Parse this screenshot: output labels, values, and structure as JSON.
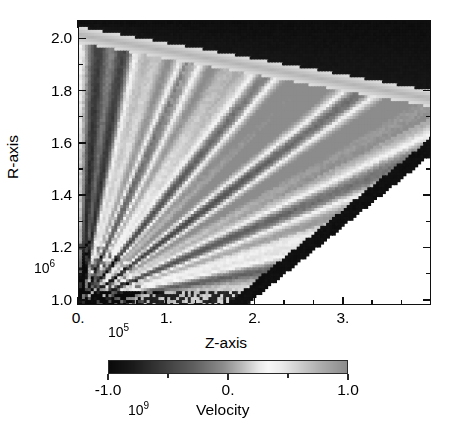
{
  "figure": {
    "kind": "pseudocolor-image-plot"
  },
  "axes": {
    "x": {
      "title": "Z-axis",
      "exponent_text": "10",
      "exponent_sup": "5",
      "tick_labels": [
        "0.",
        "1.",
        "2.",
        "3."
      ],
      "tick_values": [
        0,
        1,
        2,
        3
      ],
      "minor_per_interval": 2,
      "range": [
        0.0,
        4.0
      ]
    },
    "y": {
      "title": "R-axis",
      "exponent_text": "10",
      "exponent_sup": "6",
      "tick_labels": [
        "2.0",
        "1.8",
        "1.6",
        "1.4",
        "1.2",
        "1.0"
      ],
      "tick_values": [
        2.0,
        1.8,
        1.6,
        1.4,
        1.2,
        1.0
      ],
      "minor_per_interval": 1,
      "range": [
        0.98,
        2.07
      ]
    }
  },
  "colorbar": {
    "title": "Velocity",
    "exponent_text": "10",
    "exponent_sup": "9",
    "tick_labels": [
      "-1.0",
      "0.",
      "1.0"
    ],
    "tick_values": [
      -1.0,
      0.0,
      1.0
    ],
    "minor_tick_values": [
      -0.5,
      0.5
    ],
    "range": [
      -1.0,
      1.0
    ]
  },
  "chart_data": {
    "type": "heatmap",
    "title": "",
    "xlabel": "Z-axis",
    "ylabel": "R-axis",
    "zlabel": "Velocity",
    "xlim": [
      0.0,
      4.0
    ],
    "ylim": [
      0.98,
      2.07
    ],
    "zlim": [
      -1.0,
      1.0
    ],
    "x_units_exponent": 5,
    "y_units_exponent": 6,
    "z_units_exponent": 9,
    "grid": false,
    "legend_position": "below",
    "colormap": "grayscale-diverging",
    "colormap_stops": [
      {
        "t": 0.0,
        "gray": 10
      },
      {
        "t": 0.1,
        "gray": 26
      },
      {
        "t": 0.22,
        "gray": 58
      },
      {
        "t": 0.36,
        "gray": 96
      },
      {
        "t": 0.48,
        "gray": 140
      },
      {
        "t": 0.56,
        "gray": 186
      },
      {
        "t": 0.63,
        "gray": 232
      },
      {
        "t": 0.67,
        "gray": 247
      },
      {
        "t": 0.72,
        "gray": 236
      },
      {
        "t": 0.8,
        "gray": 206
      },
      {
        "t": 0.88,
        "gray": 176
      },
      {
        "t": 1.0,
        "gray": 140
      }
    ],
    "geometry": {
      "description": "Radial fan of alternating high/low velocity rays emanating from the lower-left origin; wedge bounded above by a dark shell and below-right by a dark diagonal front, outside of which the domain is blank white.",
      "origin_xy": [
        0.02,
        0.99
      ],
      "upper_shell_dark": true,
      "lower_diagonal_front_dark": true,
      "blank_region": "below-right of diagonal front",
      "n_cells_x": 120,
      "n_cells_y": 96
    },
    "rays": [
      {
        "angle_deg": 86.0,
        "width_deg": 3.2,
        "amplitude": -0.92
      },
      {
        "angle_deg": 80.5,
        "width_deg": 2.6,
        "amplitude": -0.88
      },
      {
        "angle_deg": 75.0,
        "width_deg": 3.0,
        "amplitude": 0.34
      },
      {
        "angle_deg": 70.0,
        "width_deg": 2.4,
        "amplitude": 0.62
      },
      {
        "angle_deg": 65.5,
        "width_deg": 2.8,
        "amplitude": -0.55
      },
      {
        "angle_deg": 61.0,
        "width_deg": 2.2,
        "amplitude": 0.48
      },
      {
        "angle_deg": 56.0,
        "width_deg": 3.0,
        "amplitude": 0.18
      },
      {
        "angle_deg": 51.0,
        "width_deg": 2.6,
        "amplitude": -0.72
      },
      {
        "angle_deg": 46.5,
        "width_deg": 2.4,
        "amplitude": 0.55
      },
      {
        "angle_deg": 42.0,
        "width_deg": 2.8,
        "amplitude": 0.7
      },
      {
        "angle_deg": 37.0,
        "width_deg": 2.4,
        "amplitude": -0.8
      },
      {
        "angle_deg": 32.5,
        "width_deg": 2.6,
        "amplitude": 0.66
      },
      {
        "angle_deg": 28.0,
        "width_deg": 2.4,
        "amplitude": 0.4
      },
      {
        "angle_deg": 23.5,
        "width_deg": 2.6,
        "amplitude": -0.6
      },
      {
        "angle_deg": 19.0,
        "width_deg": 2.4,
        "amplitude": 0.52
      },
      {
        "angle_deg": 14.5,
        "width_deg": 2.6,
        "amplitude": 0.3
      },
      {
        "angle_deg": 10.0,
        "width_deg": 2.4,
        "amplitude": -0.45
      }
    ]
  }
}
